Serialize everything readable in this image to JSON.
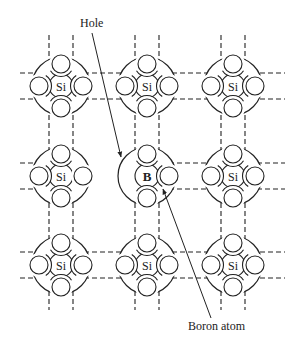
{
  "diagram": {
    "type": "crystal-lattice",
    "grid": {
      "columns_x": [
        61,
        147,
        233
      ],
      "rows_y": [
        86,
        176,
        265
      ],
      "nucleus_radius": 12,
      "shell_radius": 29,
      "electron_radius": 9,
      "electron_offset": 22
    },
    "atoms": [
      {
        "id": "si-r1c1",
        "label": "Si",
        "row": 0,
        "col": 0
      },
      {
        "id": "si-r1c2",
        "label": "Si",
        "row": 0,
        "col": 1
      },
      {
        "id": "si-r1c3",
        "label": "Si",
        "row": 0,
        "col": 2
      },
      {
        "id": "si-r2c1",
        "label": "Si",
        "row": 1,
        "col": 0
      },
      {
        "id": "b-r2c2",
        "label": "B",
        "row": 1,
        "col": 1
      },
      {
        "id": "si-r2c3",
        "label": "Si",
        "row": 1,
        "col": 2
      },
      {
        "id": "si-r3c1",
        "label": "Si",
        "row": 2,
        "col": 0
      },
      {
        "id": "si-r3c2",
        "label": "Si",
        "row": 2,
        "col": 1
      },
      {
        "id": "si-r3c3",
        "label": "Si",
        "row": 2,
        "col": 2
      }
    ],
    "annotations": {
      "hole": {
        "text": "Hole",
        "x": 80,
        "y": 27,
        "line_from": [
          92,
          33
        ],
        "line_to": [
          121,
          157
        ]
      },
      "boron": {
        "text": "Boron atom",
        "x": 188,
        "y": 330,
        "line_from": [
          211,
          318
        ],
        "line_to": [
          163,
          189
        ]
      }
    },
    "missing_bond": "between Si (row 2, col 1) and B (row 2, col 2)"
  }
}
